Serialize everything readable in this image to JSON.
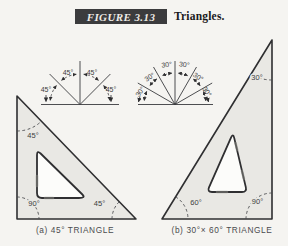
{
  "header": {
    "figure_label": "FIGURE 3.13",
    "title": "Triangles."
  },
  "fan_45": {
    "labels": [
      "45°",
      "45°",
      "45°",
      "45°"
    ]
  },
  "fan_30": {
    "labels": [
      "30°",
      "30°",
      "30°",
      "30°",
      "30°",
      "30°"
    ]
  },
  "triangle_a": {
    "angle_top": "45°",
    "angle_bottom_left": "90°",
    "angle_bottom_right": "45°",
    "caption": "(a) 45° TRIANGLE"
  },
  "triangle_b": {
    "angle_top": "30°",
    "angle_bottom_left": "60°",
    "angle_bottom_right": "90°",
    "caption": "(b) 30°× 60° TRIANGLE"
  },
  "colors": {
    "badge_background": "#3b3b3d",
    "badge_text": "#efece7",
    "line": "#2f2f31",
    "triangle_fill": "#e9e8e4",
    "label_text": "#3c3d40",
    "page_background": "#f5f4f1"
  }
}
